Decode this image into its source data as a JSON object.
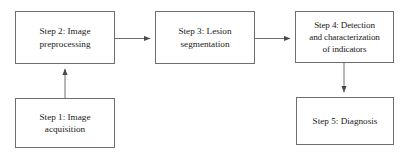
{
  "diagram": {
    "type": "flowchart",
    "orientation": "left-to-right",
    "background_color": "#ffffff",
    "stroke_color": "#6e6e6e",
    "text_color": "#1a1a1a",
    "nodes": [
      {
        "id": "step1",
        "label": "Step 1: Image\nacquisition",
        "shape": "rectangle"
      },
      {
        "id": "step2",
        "label": "Step 2: Image\npreprocessing",
        "shape": "rectangle"
      },
      {
        "id": "step3",
        "label": "Step 3: Lesion\nsegmentation",
        "shape": "rectangle"
      },
      {
        "id": "step4",
        "label": "Step 4: Detection\nand characterization\nof indicators",
        "shape": "rectangle"
      },
      {
        "id": "step5",
        "label": "Step 5: Diagnosis",
        "shape": "rectangle"
      }
    ],
    "edges": [
      {
        "id": "edge-step1-step2",
        "from": "step1",
        "to": "step2",
        "direction": "up",
        "label": ""
      },
      {
        "id": "edge-step2-step3",
        "from": "step2",
        "to": "step3",
        "direction": "right",
        "label": ""
      },
      {
        "id": "edge-step3-step4",
        "from": "step3",
        "to": "step4",
        "direction": "right",
        "label": ""
      },
      {
        "id": "edge-step4-step5",
        "from": "step4",
        "to": "step5",
        "direction": "down",
        "label": ""
      }
    ]
  }
}
